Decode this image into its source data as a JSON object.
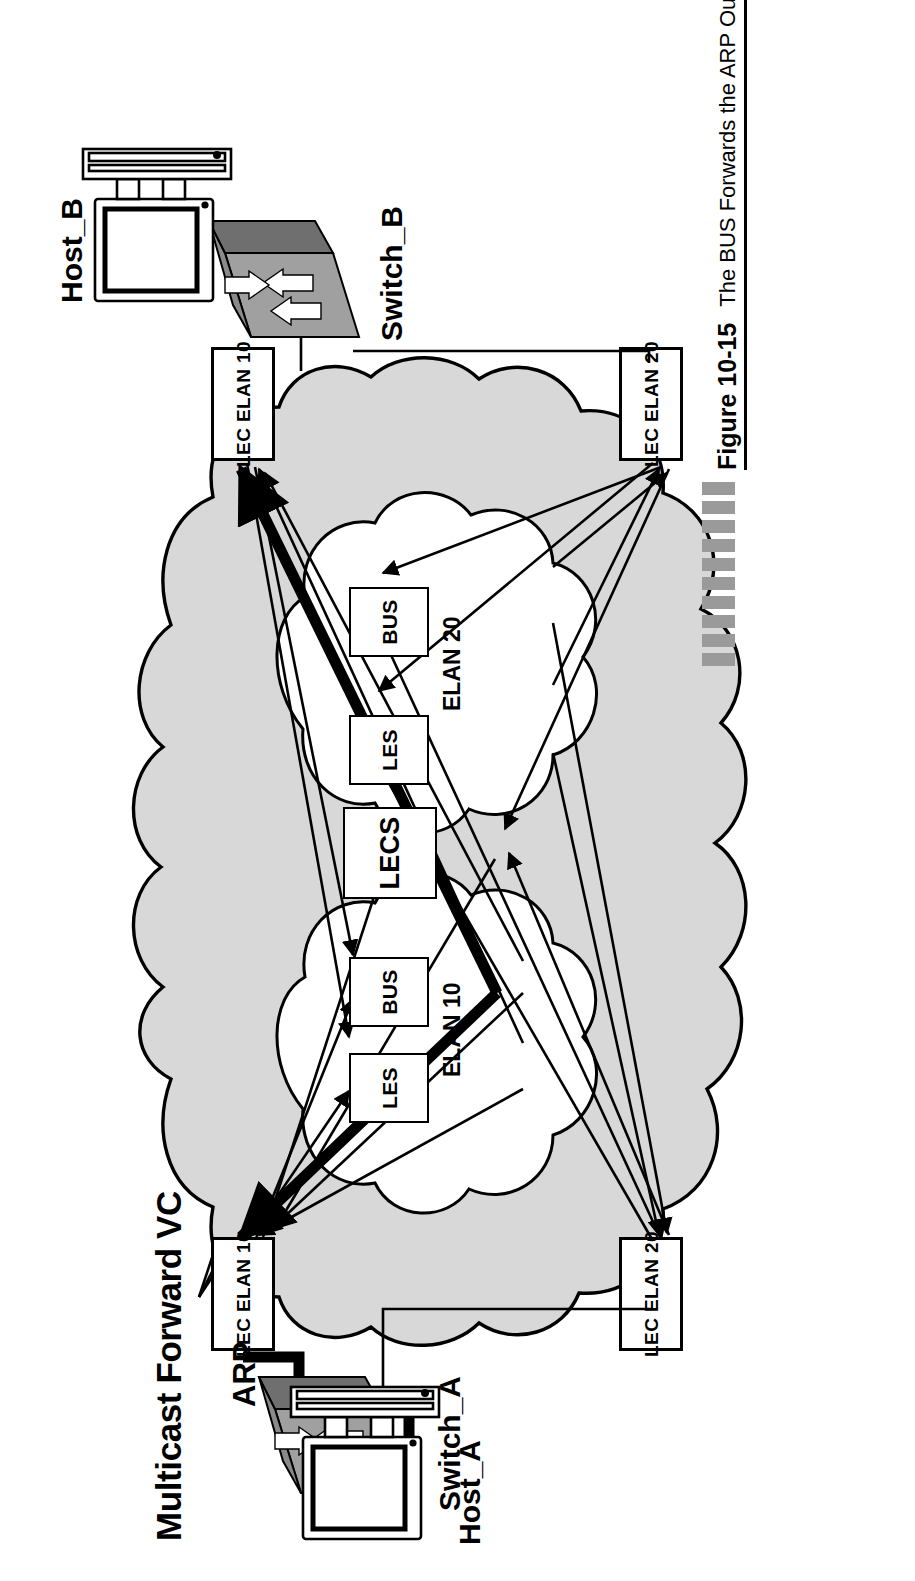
{
  "figure": {
    "title": "Multicast Forward VC",
    "number": "Figure 10-15",
    "caption": "The BUS Forwards the ARP Out the Multicast Forward VC",
    "caption_rule_color": "#000000",
    "dash_color": "#9a9a9a",
    "dash_count": 10
  },
  "colors": {
    "cloud_outer_fill": "#d8d8d8",
    "cloud_inner_fill": "#ffffff",
    "outline": "#000000",
    "switch_face": "#a0a0a0",
    "switch_top": "#8a8a8a",
    "switch_side": "#6f6f6f",
    "highlight_vc": "#000000",
    "background": "#ffffff"
  },
  "nodes": {
    "host_a": {
      "label": "Host_A",
      "icon": "desktop-computer-icon"
    },
    "host_b": {
      "label": "Host_B",
      "icon": "desktop-computer-icon"
    },
    "switch_a": {
      "label": "Switch_A",
      "icon": "ethernet-switch-icon"
    },
    "switch_b": {
      "label": "Switch_B",
      "icon": "ethernet-switch-icon"
    }
  },
  "edge_boxes": [
    {
      "id": "lec-a-10",
      "label": "LEC ELAN 10",
      "side": "left",
      "elan": "10"
    },
    {
      "id": "lec-a-20",
      "label": "LEC ELAN 20",
      "side": "left",
      "elan": "20"
    },
    {
      "id": "lec-b-10",
      "label": "LEC ELAN 10",
      "side": "right",
      "elan": "10"
    },
    {
      "id": "lec-b-20",
      "label": "LEC ELAN 20",
      "side": "right",
      "elan": "20"
    }
  ],
  "annotations": {
    "arp": "ARP"
  },
  "cloud": {
    "elan10": {
      "name": "ELAN 10",
      "services": [
        {
          "id": "les-10",
          "label": "LES"
        },
        {
          "id": "bus-10",
          "label": "BUS"
        }
      ]
    },
    "elan20": {
      "name": "ELAN 20",
      "services": [
        {
          "id": "les-20",
          "label": "LES"
        },
        {
          "id": "bus-20",
          "label": "BUS"
        }
      ]
    },
    "lecs": {
      "id": "lecs",
      "label": "LECS"
    }
  }
}
